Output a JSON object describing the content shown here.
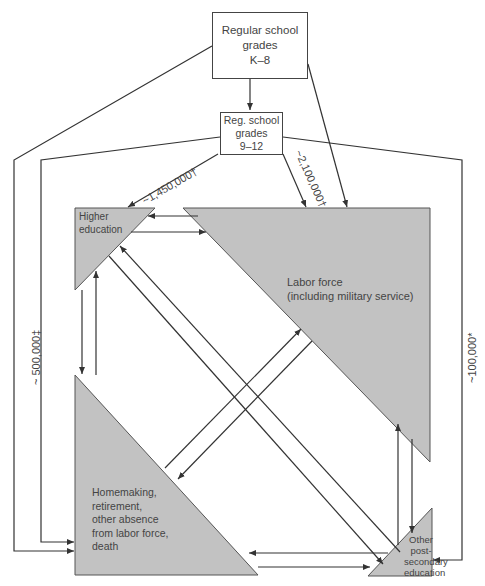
{
  "nodes": {
    "k8": {
      "label": "Regular school\ngrades\nK–8"
    },
    "g912": {
      "label": "Reg. school\ngrades\n9–12"
    },
    "higher_ed": {
      "label": "Higher\neducation"
    },
    "labor": {
      "label": "Labor force\n(including military service)"
    },
    "homemaking": {
      "label": "Homemaking,\nretirement,\nother absence\nfrom labor force,\ndeath"
    },
    "other_post": {
      "label": "Other\npost-\nsecondary\neducation"
    }
  },
  "flows": {
    "to_higher_ed": "~1,450,000†",
    "to_labor": "~2,100,000†",
    "to_homemaking": "~ 500,000‡",
    "to_other_post": "~100,000*"
  },
  "colors": {
    "triangle_fill": "#c2c2c2",
    "line": "#333333",
    "background": "#ffffff"
  }
}
